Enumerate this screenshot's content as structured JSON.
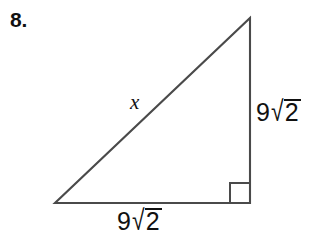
{
  "figure": {
    "problem_number": "8.",
    "shape": "right-triangle",
    "stroke_color": "#4a4a4a",
    "text_color": "#111111",
    "background_color": "#ffffff",
    "vertices": {
      "apex": [
        250,
        18
      ],
      "bottom_left": [
        55,
        203
      ],
      "bottom_right": [
        250,
        203
      ]
    },
    "right_angle_marker": {
      "at_vertex": "bottom_right",
      "size": 20
    },
    "labels": {
      "hypotenuse": {
        "text": "x",
        "style": "italic"
      },
      "right_leg": {
        "coefficient": "9",
        "radicand": "2",
        "radical_sign": "√",
        "full_text": "9√2"
      },
      "base": {
        "coefficient": "9",
        "radicand": "2",
        "radical_sign": "√",
        "full_text": "9√2"
      }
    }
  }
}
